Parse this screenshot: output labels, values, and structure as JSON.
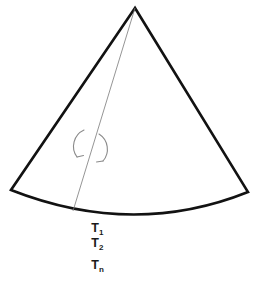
{
  "figure": {
    "name": "circular-sector-diagram",
    "background_color": "#ffffff",
    "outline_color": "#121212",
    "thin_line_color": "#7a7a7a",
    "text_color": "#1a1a1a",
    "outline_width": 2.6,
    "thin_line_width": 0.8
  },
  "geometry": {
    "apex": {
      "x": 135,
      "y": 8
    },
    "left_corner": {
      "x": 11,
      "y": 190
    },
    "right_corner": {
      "x": 248,
      "y": 192
    },
    "arc_bottom": {
      "x": 140,
      "y": 224
    },
    "radius_foot": {
      "x": 73,
      "y": 211
    },
    "arc_sagitta": 34,
    "sector_path": "M 135 8 L 11 190 Q 133 238 248 192 Z",
    "radius_line": {
      "x1": 135,
      "y1": 8,
      "x2": 73,
      "y2": 211
    }
  },
  "rotation_symbol": {
    "name": "rotation-arrow",
    "center": {
      "x": 91,
      "y": 146
    },
    "radius": 17,
    "arc_left_path": "M 82 131 A 17 17 0 0 0 78 158",
    "arc_right_path": "M 100 133 A 17 17 0 0 1 102 160",
    "color": "#8a8a8a",
    "stroke_width": 1.1
  },
  "labels": {
    "t1": {
      "base": "T",
      "sub": "1",
      "x": 60,
      "y": 232
    },
    "t2": {
      "base": "T",
      "sub": "2",
      "x": 60,
      "y": 247
    },
    "tn": {
      "base": "T",
      "sub": "n",
      "x": 60,
      "y": 269
    }
  },
  "chart_data": {
    "type": "diagram",
    "elements": [
      {
        "kind": "sector-outline",
        "vertices": [
          "apex",
          "left_corner",
          "arc",
          "right_corner"
        ]
      },
      {
        "kind": "radius-line",
        "from": "apex",
        "to": "arc",
        "style": "thin-gray"
      },
      {
        "kind": "rotation-arrow",
        "about": "radius-line"
      },
      {
        "kind": "label",
        "text": "T1"
      },
      {
        "kind": "label",
        "text": "T2"
      },
      {
        "kind": "label",
        "text": "Tn"
      }
    ],
    "labels": [
      "T1",
      "T2",
      "Tn"
    ]
  }
}
